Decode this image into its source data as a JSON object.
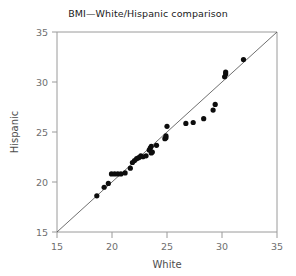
{
  "chart_data": {
    "type": "scatter",
    "title": "BMI—White/Hispanic comparison",
    "xlabel": "White",
    "ylabel": "Hispanic",
    "xlim": [
      14,
      35
    ],
    "ylim": [
      14,
      35
    ],
    "xticks": [
      "15",
      "20",
      "25",
      "30",
      "35"
    ],
    "yticks": [
      "15",
      "20",
      "25",
      "30",
      "35"
    ],
    "xtick_values": [
      15,
      20,
      25,
      30,
      35
    ],
    "ytick_values": [
      15,
      20,
      25,
      30,
      35
    ],
    "grid": false,
    "legend": "none",
    "reference_line": {
      "name": "y = x identity line",
      "from": [
        14,
        14
      ],
      "to": [
        35,
        35
      ]
    },
    "marker": {
      "shape": "circle",
      "color": "#0d0d0d",
      "size_px": 4
    },
    "points": [
      {
        "x": 17.8,
        "y": 17.8
      },
      {
        "x": 18.5,
        "y": 18.7
      },
      {
        "x": 18.9,
        "y": 19.1
      },
      {
        "x": 19.2,
        "y": 20.1
      },
      {
        "x": 19.5,
        "y": 20.1
      },
      {
        "x": 19.8,
        "y": 20.1
      },
      {
        "x": 20.1,
        "y": 20.1
      },
      {
        "x": 20.5,
        "y": 20.2
      },
      {
        "x": 21.0,
        "y": 20.7
      },
      {
        "x": 21.2,
        "y": 21.3
      },
      {
        "x": 21.4,
        "y": 21.5
      },
      {
        "x": 21.6,
        "y": 21.7
      },
      {
        "x": 21.8,
        "y": 21.8
      },
      {
        "x": 22.0,
        "y": 22.0
      },
      {
        "x": 22.2,
        "y": 21.9
      },
      {
        "x": 22.5,
        "y": 22.0
      },
      {
        "x": 22.8,
        "y": 22.6
      },
      {
        "x": 22.9,
        "y": 22.8
      },
      {
        "x": 23.0,
        "y": 23.0
      },
      {
        "x": 23.0,
        "y": 22.3
      },
      {
        "x": 23.1,
        "y": 22.4
      },
      {
        "x": 23.5,
        "y": 23.1
      },
      {
        "x": 24.3,
        "y": 23.8
      },
      {
        "x": 24.4,
        "y": 23.9
      },
      {
        "x": 24.4,
        "y": 24.1
      },
      {
        "x": 24.5,
        "y": 25.1
      },
      {
        "x": 26.3,
        "y": 25.4
      },
      {
        "x": 27.0,
        "y": 25.5
      },
      {
        "x": 28.0,
        "y": 25.9
      },
      {
        "x": 28.9,
        "y": 26.8
      },
      {
        "x": 29.1,
        "y": 27.4
      },
      {
        "x": 30.0,
        "y": 30.3
      },
      {
        "x": 30.1,
        "y": 30.6
      },
      {
        "x": 30.1,
        "y": 30.8
      },
      {
        "x": 31.8,
        "y": 32.1
      }
    ]
  },
  "colors": {
    "point": "#0d0d0d",
    "frame": "#9a9a9a",
    "reference_line": "#4a4a4a",
    "tick_text": "#6e6e6e",
    "axis_title": "#4d4d4d",
    "title_text": "#1a1a1a",
    "background": "#ffffff"
  }
}
